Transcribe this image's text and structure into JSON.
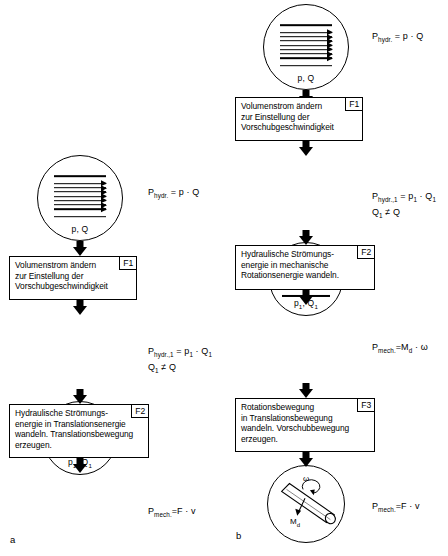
{
  "figure": {
    "panels": [
      {
        "letter": "a",
        "nodes": [
          {
            "kind": "hydraulic-circle",
            "caption": "p, Q",
            "flow_lines": 7,
            "formula": "P<sub>hydr.</sub> = p · Q"
          },
          {
            "kind": "process-box",
            "tag": "F1",
            "text": "Volumenstrom ändern\nzur Einstellung der\nVorschubgeschwindigkeit"
          },
          {
            "kind": "hydraulic-circle",
            "caption": "p₁, Q₁",
            "flow_lines": 4,
            "formula": "P<sub>hydr.,1</sub> = p<sub>1</sub> · Q<sub>1</sub>\nQ<sub>1</sub> ≠ Q"
          },
          {
            "kind": "process-box",
            "tag": "F2",
            "text": "Hydraulische Strömungs-\nenergie in Translationsenergie\nwandeln. Translationsbewegung\nerzeugen."
          },
          {
            "kind": "mass-circle",
            "labels": {
              "mass": "m",
              "force": "F",
              "velocity": "v"
            },
            "formula": "P<sub>mech.</sub>=F · v"
          }
        ]
      },
      {
        "letter": "b",
        "nodes": [
          {
            "kind": "hydraulic-circle",
            "caption": "p, Q",
            "flow_lines": 7,
            "formula": "P<sub>hydr.</sub> = p · Q"
          },
          {
            "kind": "process-box",
            "tag": "F1",
            "text": "Volumenstrom ändern\nzur Einstellung der\nVorschubgeschwindigkeit"
          },
          {
            "kind": "hydraulic-circle",
            "caption": "p₁, Q₁",
            "flow_lines": 4,
            "formula": "P<sub>hydr.,1</sub> = p<sub>1</sub> · Q<sub>1</sub>\nQ<sub>1</sub> ≠ Q"
          },
          {
            "kind": "process-box",
            "tag": "F2",
            "text": "Hydraulische Strömungs-\nenergie in mechanische\nRotationsenergie wandeln."
          },
          {
            "kind": "shaft-circle",
            "labels": {
              "omega": "ω",
              "torque": "M<sub>d</sub>"
            },
            "formula": "P<sub>mech.</sub>=M<sub>d</sub> · ω"
          },
          {
            "kind": "process-box",
            "tag": "F3",
            "text": "Rotationsbewegung\nin Translationsbewegung\nwandeln. Vorschubbewegung\nerzeugen."
          },
          {
            "kind": "mass-circle",
            "labels": {
              "mass": "m",
              "force": "F",
              "velocity": "v"
            },
            "formula": "P<sub>mech.</sub>=F · v"
          }
        ]
      }
    ]
  },
  "colors": {
    "ink": "#000000",
    "paper": "#ffffff"
  }
}
